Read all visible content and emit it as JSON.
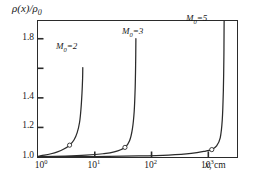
{
  "chart_data": {
    "type": "line",
    "title": "",
    "xlabel": "x, cm",
    "ylabel": "ρ(x)/ρ₀",
    "xscale": "log",
    "yscale": "linear",
    "xlim": [
      1,
      3200
    ],
    "ylim": [
      1.0,
      1.92
    ],
    "grid": false,
    "legend_position": "inline-annotations",
    "xticks": [
      {
        "label": "10",
        "exponent": "0",
        "value": 1
      },
      {
        "label": "10",
        "exponent": "1",
        "value": 10
      },
      {
        "label": "10",
        "exponent": "2",
        "value": 100
      },
      {
        "label": "10",
        "exponent": "3",
        "value": 1000
      }
    ],
    "yticks": [
      {
        "label": "1.8",
        "value": 1.8
      },
      {
        "label": "1.4",
        "value": 1.4
      },
      {
        "label": "1.2",
        "value": 1.2
      },
      {
        "label": "1.0",
        "value": 1.0
      }
    ],
    "series": [
      {
        "name": "M₀=2",
        "annotation": "M0=2",
        "annotation_base": "M",
        "annotation_sub": "0",
        "annotation_tail": "=2",
        "marker": "open-circle",
        "marker_point": {
          "x": 3.6,
          "y": 1.08
        },
        "points": [
          {
            "x": 1.0,
            "y": 1.005
          },
          {
            "x": 1.3,
            "y": 1.012
          },
          {
            "x": 1.7,
            "y": 1.022
          },
          {
            "x": 2.2,
            "y": 1.035
          },
          {
            "x": 2.8,
            "y": 1.052
          },
          {
            "x": 3.6,
            "y": 1.08
          },
          {
            "x": 4.3,
            "y": 1.115
          },
          {
            "x": 4.9,
            "y": 1.165
          },
          {
            "x": 5.4,
            "y": 1.235
          },
          {
            "x": 5.7,
            "y": 1.32
          },
          {
            "x": 5.95,
            "y": 1.43
          },
          {
            "x": 6.1,
            "y": 1.53
          },
          {
            "x": 6.15,
            "y": 1.605
          }
        ]
      },
      {
        "name": "M₀=3",
        "annotation": "M0=3",
        "annotation_base": "M",
        "annotation_sub": "0",
        "annotation_tail": "=3",
        "marker": "open-circle",
        "marker_point": {
          "x": 34,
          "y": 1.065
        },
        "points": [
          {
            "x": 1.0,
            "y": 1.002
          },
          {
            "x": 3.0,
            "y": 1.006
          },
          {
            "x": 7.0,
            "y": 1.012
          },
          {
            "x": 14.0,
            "y": 1.022
          },
          {
            "x": 22.0,
            "y": 1.035
          },
          {
            "x": 34.0,
            "y": 1.065
          },
          {
            "x": 41.0,
            "y": 1.11
          },
          {
            "x": 46.0,
            "y": 1.19
          },
          {
            "x": 49.5,
            "y": 1.31
          },
          {
            "x": 51.5,
            "y": 1.47
          },
          {
            "x": 52.5,
            "y": 1.64
          },
          {
            "x": 53.0,
            "y": 1.8
          }
        ]
      },
      {
        "name": "M₀=5",
        "annotation": "M0=5",
        "annotation_base": "M",
        "annotation_sub": "0",
        "annotation_tail": "=5",
        "marker": "open-circle",
        "marker_point": {
          "x": 1150,
          "y": 1.05
        },
        "points": [
          {
            "x": 1.0,
            "y": 1.001
          },
          {
            "x": 10.0,
            "y": 1.003
          },
          {
            "x": 60.0,
            "y": 1.007
          },
          {
            "x": 200.0,
            "y": 1.013
          },
          {
            "x": 500.0,
            "y": 1.024
          },
          {
            "x": 900.0,
            "y": 1.04
          },
          {
            "x": 1150.0,
            "y": 1.05
          },
          {
            "x": 1400.0,
            "y": 1.075
          },
          {
            "x": 1620.0,
            "y": 1.13
          },
          {
            "x": 1760.0,
            "y": 1.25
          },
          {
            "x": 1840.0,
            "y": 1.45
          },
          {
            "x": 1880.0,
            "y": 1.68
          },
          {
            "x": 1895.0,
            "y": 1.88
          },
          {
            "x": 1900.0,
            "y": 1.92
          }
        ]
      }
    ]
  },
  "axes": {
    "y_label_main": "ρ(x)/",
    "y_label_rho": "ρ",
    "y_label_sub": "0",
    "x_label_var": "x",
    "x_label_unit": ", cm"
  },
  "colors": {
    "curve": "#2b2b2b",
    "frame": "#2b2b2b",
    "background": "#ffffff",
    "marker_fill": "#ffffff"
  }
}
